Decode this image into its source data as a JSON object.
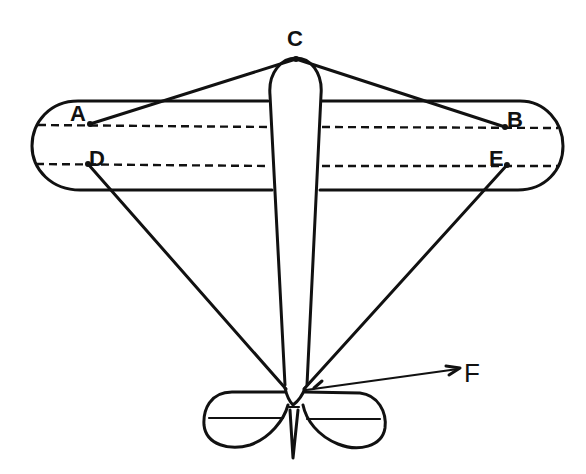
{
  "diagram": {
    "type": "top-view aircraft bracing diagram",
    "colors": {
      "ink": "#111111",
      "background": "#ffffff"
    },
    "labels": {
      "A": "A",
      "B": "B",
      "C": "C",
      "D": "D",
      "E": "E",
      "F": "F"
    },
    "points": {
      "A": [
        90,
        124
      ],
      "B": [
        505,
        127
      ],
      "C": [
        296,
        59
      ],
      "D": [
        88,
        164
      ],
      "E": [
        507,
        165
      ],
      "tail_junction": [
        293,
        390
      ],
      "F_tip": [
        462,
        368
      ]
    },
    "wires": [
      {
        "from": "C",
        "to": "A"
      },
      {
        "from": "C",
        "to": "B"
      },
      {
        "from": "D",
        "to": "tail_junction"
      },
      {
        "from": "E",
        "to": "tail_junction"
      }
    ],
    "force_arrow": {
      "from": "tail_junction",
      "to": "F_tip",
      "label": "F"
    }
  }
}
